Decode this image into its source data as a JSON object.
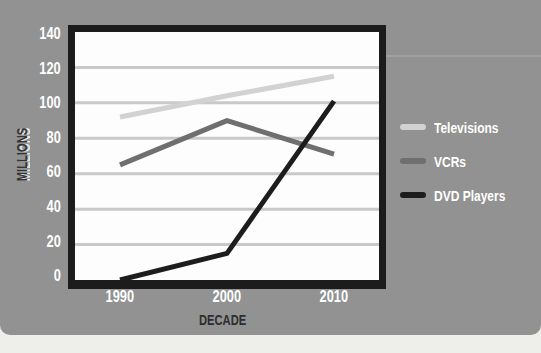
{
  "page": {
    "background": "#eeeeea",
    "card_color": "#929292"
  },
  "chart_data": {
    "type": "line",
    "title": "",
    "xlabel": "DECADE",
    "ylabel": "MILLIONS",
    "categories": [
      "1990",
      "2000",
      "2010"
    ],
    "x_tick_labels": [
      "1990",
      "2000",
      "2010"
    ],
    "y_tick_labels": [
      "140",
      "120",
      "100",
      "80",
      "60",
      "40",
      "20",
      "0"
    ],
    "ylim": [
      0,
      140
    ],
    "y_tick_step": 20,
    "grid": true,
    "legend_position": "right",
    "series": [
      {
        "name": "Televisions",
        "values": [
          92,
          104,
          115
        ],
        "color": "#d2d2d2"
      },
      {
        "name": "VCRs",
        "values": [
          65,
          90,
          71
        ],
        "color": "#6f6f6f"
      },
      {
        "name": "DVD Players",
        "values": [
          0,
          15,
          101
        ],
        "color": "#1d1d1d"
      }
    ]
  },
  "style": {
    "plot_bg": "#fdfdfd",
    "frame_color": "#1c1c1c",
    "gridline_color": "#c9c9c9",
    "tick_text_color": "#ffffff",
    "xlabel_color": "#2d2d2d",
    "ylabel_color": "#333333"
  }
}
